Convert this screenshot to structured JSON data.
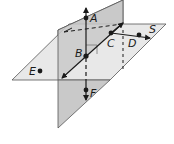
{
  "diagram": {
    "type": "intersecting-planes",
    "planes": [
      {
        "name": "vertical-plane",
        "fill": "#c8c8c8"
      },
      {
        "name": "horizontal-plane",
        "label": "S",
        "fill": "#e6e6e6"
      }
    ],
    "points": [
      {
        "label": "A",
        "x": 86,
        "y": 18
      },
      {
        "label": "B",
        "x": 86,
        "y": 56
      },
      {
        "label": "C",
        "x": 111,
        "y": 33
      },
      {
        "label": "D",
        "x": 139,
        "y": 35
      },
      {
        "label": "E",
        "x": 40,
        "y": 71
      },
      {
        "label": "F",
        "x": 86,
        "y": 90
      }
    ],
    "labels": {
      "A": "A",
      "B": "B",
      "C": "C",
      "D": "D",
      "E": "E",
      "F": "F",
      "S": "S"
    },
    "colors": {
      "line": "#1a1a1a",
      "vertical_plane": "#c9c9c9",
      "horizontal_plane": "#e8e8e8",
      "background": "#ffffff"
    }
  }
}
